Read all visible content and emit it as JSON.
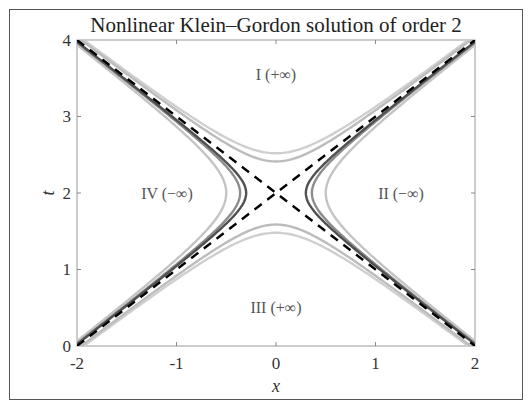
{
  "chart_data": {
    "type": "line",
    "title": "Nonlinear Klein–Gordon solution of order 2",
    "xlabel": "x",
    "ylabel": "t",
    "xlim": [
      -2,
      2
    ],
    "ylim": [
      0,
      4
    ],
    "xticks": [
      -2,
      -1,
      0,
      1,
      2
    ],
    "xtick_labels": [
      "-2",
      "-1",
      "0",
      "1",
      "2"
    ],
    "yticks": [
      0,
      1,
      2,
      3,
      4
    ],
    "ytick_labels": [
      "0",
      "1",
      "2",
      "3",
      "4"
    ],
    "grid": false,
    "legend": null,
    "annotations": [
      {
        "text": "I (+∞)",
        "x": 0,
        "y": 3.5
      },
      {
        "text": "II (−∞)",
        "x": 1.3,
        "y": 2
      },
      {
        "text": "III (+∞)",
        "x": 0,
        "y": 0.7
      },
      {
        "text": "IV (−∞)",
        "x": -1.3,
        "y": 2
      }
    ],
    "series": [
      {
        "name": "asymptote t-2 = x",
        "style": "dashed",
        "color": "#000000",
        "points": [
          [
            -2,
            0
          ],
          [
            2,
            4
          ]
        ]
      },
      {
        "name": "asymptote t-2 = -x",
        "style": "dashed",
        "color": "#000000",
        "points": [
          [
            -2,
            4
          ],
          [
            2,
            0
          ]
        ]
      },
      {
        "name": "level curve vertical, outer",
        "style": "solid",
        "color": "#c8c8c8",
        "equation": "(t-2)^2 - x^2 = 0.27",
        "vertex_t": [
          2.52,
          1.48
        ]
      },
      {
        "name": "level curve vertical, inner",
        "style": "solid",
        "color": "#b4b4b4",
        "equation": "(t-2)^2 - x^2 = 0.17",
        "vertex_t": [
          2.41,
          1.59
        ]
      },
      {
        "name": "level curve horizontal, dark",
        "style": "solid",
        "color": "#555555",
        "equation": "x^2 - (t-2)^2 = 0.09",
        "vertex_x": [
          -0.3,
          0.3
        ]
      },
      {
        "name": "level curve horizontal, mid",
        "style": "solid",
        "color": "#8a8a8a",
        "equation": "x^2 - (t-2)^2 = 0.13",
        "vertex_x": [
          -0.36,
          0.36
        ]
      },
      {
        "name": "level curve horizontal, light",
        "style": "solid",
        "color": "#bdbdbd",
        "equation": "x^2 - (t-2)^2 = 0.25",
        "vertex_x": [
          -0.5,
          0.5
        ]
      }
    ]
  },
  "labels": {
    "title": "Nonlinear Klein–Gordon solution of order 2",
    "xlabel": "x",
    "ylabel": "t",
    "region_I": "I (+∞)",
    "region_II": "II (−∞)",
    "region_III": "III (+∞)",
    "region_IV": "IV (−∞)",
    "xt0": "-2",
    "xt1": "-1",
    "xt2": "0",
    "xt3": "1",
    "xt4": "2",
    "yt0": "0",
    "yt1": "1",
    "yt2": "2",
    "yt3": "3",
    "yt4": "4"
  }
}
